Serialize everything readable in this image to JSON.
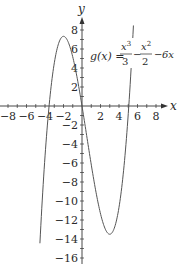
{
  "chart_data": {
    "type": "line",
    "title": "",
    "function_label": {
      "lhs": "g(x) =",
      "term1_num": "x",
      "term1_num_exp": "3",
      "term1_den": "3",
      "minus1": "−",
      "term2_num": "x",
      "term2_num_exp": "2",
      "term2_den": "2",
      "minus2": "−",
      "term3": "6x"
    },
    "expression": "g(x) = x^3/3 - x^2/2 - 6x",
    "xlabel": "x",
    "ylabel": "y",
    "xlim": [
      -8.8,
      9
    ],
    "ylim": [
      -16.5,
      9.2
    ],
    "grid": false,
    "x_ticks": [
      -8,
      -6,
      -4,
      -2,
      2,
      4,
      6,
      8
    ],
    "x_tick_labels": [
      "−8",
      "−6",
      "−4",
      "−2",
      "2",
      "4",
      "6",
      "8"
    ],
    "y_ticks": [
      8,
      6,
      4,
      2,
      -2,
      -4,
      -6,
      -8,
      -10,
      -12,
      -14,
      -16
    ],
    "y_tick_labels": [
      "8",
      "6",
      "4",
      "2",
      "−2",
      "−4",
      "−6",
      "−8",
      "−10",
      "−12",
      "−14",
      "−16"
    ],
    "minor_tick_step": 1,
    "curve_domain": [
      -4.55,
      5.56
    ],
    "key_points": [
      {
        "label": "local max",
        "x": -2,
        "y": 7.33
      },
      {
        "label": "local min",
        "x": 3,
        "y": -13.5
      },
      {
        "label": "zero",
        "x": -3.56,
        "y": 0
      },
      {
        "label": "zero",
        "x": 0,
        "y": 0
      },
      {
        "label": "zero",
        "x": 5.06,
        "y": 0
      }
    ],
    "series": [
      {
        "name": "g(x)",
        "x": [
          -4.55,
          -4.0,
          -3.5,
          -3.0,
          -2.5,
          -2.0,
          -1.5,
          -1.0,
          -0.5,
          0,
          0.5,
          1.0,
          1.5,
          2.0,
          2.5,
          3.0,
          3.5,
          4.0,
          4.5,
          5.0,
          5.56
        ],
        "values": [
          -14.56,
          -5.33,
          0.58,
          4.5,
          6.67,
          7.33,
          6.75,
          5.17,
          2.83,
          0,
          -3.08,
          -6.17,
          -9.0,
          -11.33,
          -12.92,
          -13.5,
          -12.83,
          -10.67,
          -6.75,
          -0.83,
          9.08
        ]
      }
    ],
    "color": "#555555"
  }
}
